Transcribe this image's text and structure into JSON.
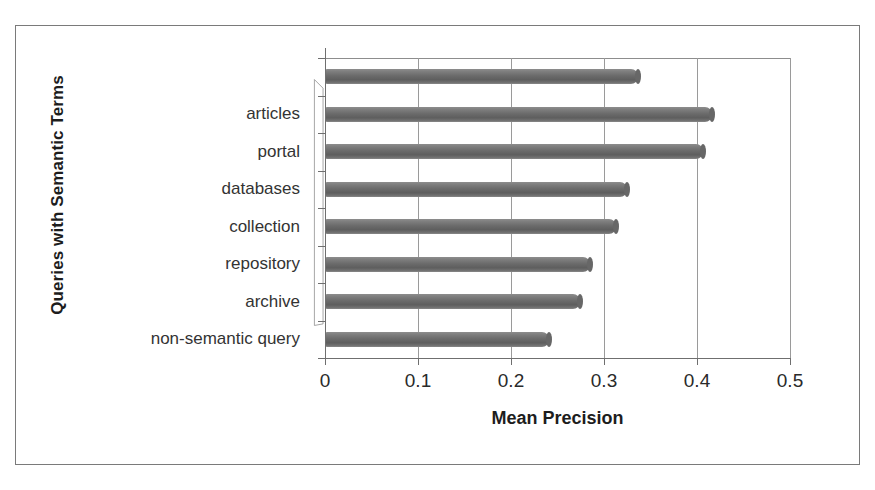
{
  "chart_data": {
    "type": "bar",
    "orientation": "horizontal",
    "title": "",
    "xlabel": "Mean Precision",
    "ylabel": "Queries with Semantic Terms",
    "xlim": [
      0,
      0.5
    ],
    "xticks": [
      "0",
      "0.1",
      "0.2",
      "0.3",
      "0.4",
      "0.5"
    ],
    "xtick_values": [
      0,
      0.1,
      0.2,
      0.3,
      0.4,
      0.5
    ],
    "grid": "vertical",
    "legend": "none",
    "bar_color": "#6b6b6b",
    "categories": [
      "",
      "articles",
      "portal",
      "databases",
      "collection",
      "repository",
      "archive",
      "non-semantic query"
    ],
    "values": [
      0.337,
      0.416,
      0.406,
      0.325,
      0.313,
      0.285,
      0.274,
      0.241
    ],
    "series": [
      {
        "name": "Mean Precision",
        "points": [
          {
            "category": "",
            "value": 0.337
          },
          {
            "category": "articles",
            "value": 0.416
          },
          {
            "category": "portal",
            "value": 0.406
          },
          {
            "category": "databases",
            "value": 0.325
          },
          {
            "category": "collection",
            "value": 0.313
          },
          {
            "category": "repository",
            "value": 0.285
          },
          {
            "category": "archive",
            "value": 0.274
          },
          {
            "category": "non-semantic query",
            "value": 0.241
          }
        ]
      }
    ]
  }
}
